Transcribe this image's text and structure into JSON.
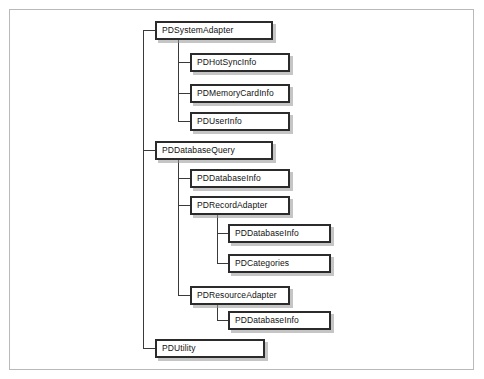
{
  "diagram": {
    "frame": {
      "border_color": "#b9b9b9"
    },
    "style": {
      "box_border_color": "#2b2b2b",
      "box_fill": "#ffffff",
      "shadow_color": "#969696",
      "connector_color": "#3a3a3a",
      "text_color": "#111111"
    },
    "nodes": [
      {
        "id": "pdsystemadapter",
        "label": "PDSystemAdapter",
        "level": 1,
        "x": 155,
        "y": 21,
        "w": 118
      },
      {
        "id": "pdhotsyncinfo",
        "label": "PDHotSyncInfo",
        "level": 2,
        "x": 190,
        "y": 53,
        "w": 100
      },
      {
        "id": "pdmemorycardinfo",
        "label": "PDMemoryCardInfo",
        "level": 2,
        "x": 190,
        "y": 84,
        "w": 100
      },
      {
        "id": "pduserinfo",
        "label": "PDUserInfo",
        "level": 2,
        "x": 190,
        "y": 112,
        "w": 100
      },
      {
        "id": "pddatabasequery",
        "label": "PDDatabaseQuery",
        "level": 1,
        "x": 155,
        "y": 141,
        "w": 118
      },
      {
        "id": "pddatabaseinfo-1",
        "label": "PDDatabaseInfo",
        "level": 2,
        "x": 190,
        "y": 169,
        "w": 100
      },
      {
        "id": "pdrecordadapter",
        "label": "PDRecordAdapter",
        "level": 2,
        "x": 190,
        "y": 196,
        "w": 100
      },
      {
        "id": "pddatabaseinfo-2",
        "label": "PDDatabaseInfo",
        "level": 3,
        "x": 228,
        "y": 224,
        "w": 103
      },
      {
        "id": "pdcategories",
        "label": "PDCategories",
        "level": 3,
        "x": 228,
        "y": 254,
        "w": 103
      },
      {
        "id": "pdresourceadapter",
        "label": "PDResourceAdapter",
        "level": 2,
        "x": 190,
        "y": 286,
        "w": 100
      },
      {
        "id": "pddatabaseinfo-3",
        "label": "PDDatabaseInfo",
        "level": 3,
        "x": 228,
        "y": 311,
        "w": 103
      },
      {
        "id": "pdutility",
        "label": "PDUtility",
        "level": 1,
        "x": 155,
        "y": 339,
        "w": 110
      }
    ],
    "connectors": {
      "root_trunk_x": 143,
      "level2_trunk_x": 178,
      "level3_trunk_x": 217
    }
  }
}
